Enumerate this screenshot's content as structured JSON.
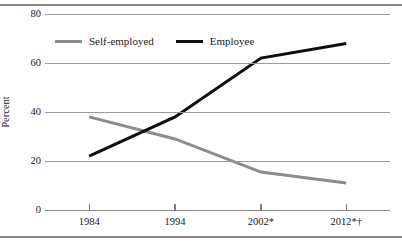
{
  "chart_data": {
    "type": "line",
    "title": "",
    "xlabel": "",
    "ylabel": "Percent",
    "categories": [
      "1984",
      "1994",
      "2002*",
      "2012*†"
    ],
    "ylim": [
      0,
      80
    ],
    "yticks": [
      0,
      20,
      40,
      60,
      80
    ],
    "ytick_labels": [
      "0",
      "20",
      "40",
      "60",
      "80"
    ],
    "grid": true,
    "legend_position": "upper-left-inside",
    "series": [
      {
        "name": "Self-employed",
        "color": "#8c8c8c",
        "values": [
          38,
          29,
          15.5,
          11
        ]
      },
      {
        "name": "Employee",
        "color": "#0d0d0d",
        "values": [
          22,
          38,
          62,
          68
        ]
      }
    ]
  },
  "axes": {
    "y_title": "Percent",
    "y_tick_labels": [
      "80",
      "60",
      "40",
      "20",
      "0"
    ],
    "x_tick_labels": [
      "1984",
      "1994",
      "2002*",
      "2012*†"
    ]
  },
  "legend": {
    "items": [
      {
        "label": "Self-employed",
        "color": "#8c8c8c"
      },
      {
        "label": "Employee",
        "color": "#0d0d0d"
      }
    ]
  },
  "style": {
    "grid_color": "#9a9a9a",
    "frame_color": "#8a8a8a",
    "text_color": "#1a1a1a"
  }
}
